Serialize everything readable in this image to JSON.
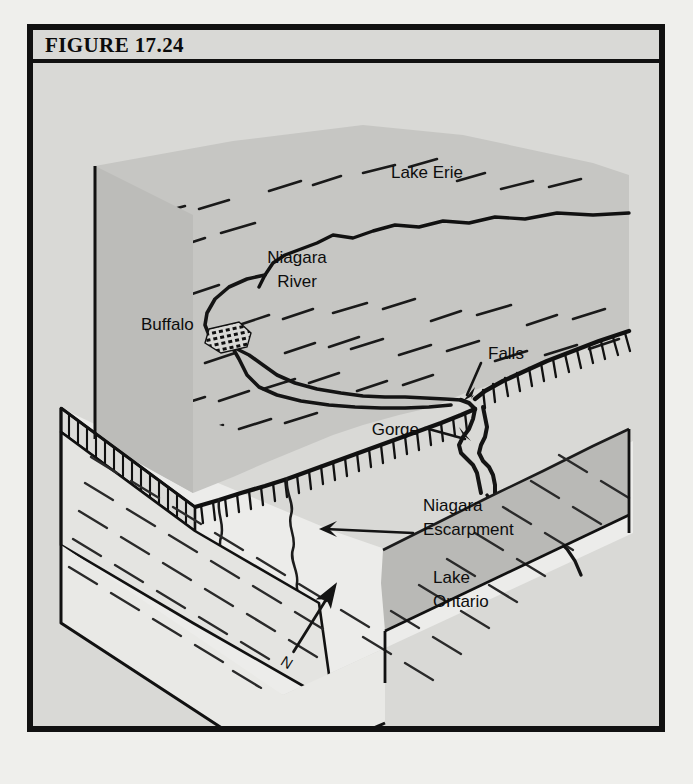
{
  "figure": {
    "label": "FIGURE 17.24",
    "kind": "block-diagram"
  },
  "colors": {
    "frame": "#111111",
    "panel_background": "#d9d9d6",
    "upper_plateau": "#c6c6c3",
    "lower_plain": "#ececea",
    "lake_water": "#b9b9b6",
    "ink": "#0d0d0d",
    "page": "#efefec"
  },
  "labels": {
    "lake_erie": "Lake Erie",
    "niagara_river_line1": "Niagara",
    "niagara_river_line2": "River",
    "buffalo": "Buffalo",
    "falls": "Falls",
    "gorge": "Gorge",
    "niagara_escarpment_line1": "Niagara",
    "niagara_escarpment_line2": "Escarpment",
    "lake_ontario_line1": "Lake",
    "lake_ontario_line2": "Ontario",
    "north": "N"
  },
  "features": [
    {
      "name": "Lake Erie",
      "type": "lake",
      "position": "upper-right of block top surface"
    },
    {
      "name": "Niagara River",
      "type": "river",
      "position": "flows north from Lake Erie to Lake Ontario"
    },
    {
      "name": "Buffalo",
      "type": "city",
      "position": "west end of Lake Erie outlet"
    },
    {
      "name": "Falls",
      "type": "waterfall",
      "position": "where river crosses the escarpment"
    },
    {
      "name": "Gorge",
      "type": "gorge",
      "position": "downstream canyon below the falls"
    },
    {
      "name": "Niagara Escarpment",
      "type": "escarpment",
      "position": "hachured cliff line crossing the block"
    },
    {
      "name": "Lake Ontario",
      "type": "lake",
      "position": "lower right, below the escarpment"
    }
  ]
}
